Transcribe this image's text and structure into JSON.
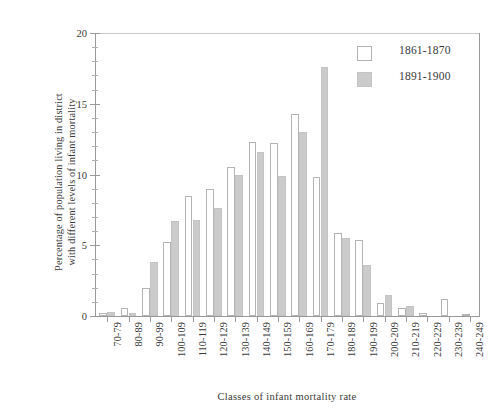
{
  "chart_data": {
    "type": "bar",
    "title": "",
    "xlabel": "Classes of infant mortality rate",
    "ylabel": "Percentage of population living in district\nwith different levels of infant mortality",
    "ylabel_line1": "Percentage of population living in district",
    "ylabel_line2": "with different levels of infant mortality",
    "categories": [
      "70-79",
      "80-89",
      "90-99",
      "100-109",
      "110-119",
      "120-129",
      "130-139",
      "140-149",
      "150-159",
      "160-169",
      "170-179",
      "180-189",
      "190-199",
      "200-209",
      "210-219",
      "220-229",
      "230-239",
      "240-249"
    ],
    "series": [
      {
        "name": "1861-1870",
        "color": "#ffffff",
        "edge_color": "#b4b4b4",
        "values": [
          0.2,
          0.6,
          2.0,
          5.2,
          8.5,
          9.0,
          10.5,
          12.3,
          12.2,
          14.3,
          9.8,
          5.9,
          5.4,
          0.9,
          0.6,
          0.2,
          1.2,
          0.1
        ]
      },
      {
        "name": "1891-1900",
        "color": "#cbcbcb",
        "edge_color": "#c4c4c4",
        "values": [
          0.3,
          0.2,
          3.8,
          6.7,
          6.8,
          7.6,
          10.0,
          11.6,
          9.9,
          13.0,
          17.6,
          5.5,
          3.6,
          1.5,
          0.7,
          0.0,
          0.0,
          0.0
        ]
      }
    ],
    "ylim": [
      0,
      20
    ],
    "yticks": [
      0,
      5,
      10,
      15,
      20
    ],
    "ytick_labels": [
      "0",
      "5",
      "10",
      "15",
      "20"
    ],
    "yminor_step": 1,
    "grid": false,
    "legend_position": "top-right"
  },
  "legend": {
    "items": [
      {
        "label": "1861-1870",
        "style": "a"
      },
      {
        "label": "1891-1900",
        "style": "b"
      }
    ]
  }
}
